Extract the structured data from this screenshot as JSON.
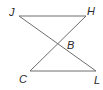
{
  "diagram": {
    "type": "geometry",
    "colors": {
      "line": "#6e6e6e",
      "label": "#2a2a2a",
      "background": "#ffffff"
    },
    "points": {
      "J": {
        "label": "J",
        "x": 19,
        "y": 16
      },
      "H": {
        "label": "H",
        "x": 86,
        "y": 16
      },
      "B": {
        "label": "B",
        "x": 58,
        "y": 44
      },
      "C": {
        "label": "C",
        "x": 30,
        "y": 71
      },
      "L": {
        "label": "L",
        "x": 96,
        "y": 71
      }
    },
    "segments": [
      {
        "name": "JH",
        "from": "J",
        "to": "H"
      },
      {
        "name": "CL",
        "from": "C",
        "to": "L"
      },
      {
        "name": "JL",
        "from": "J",
        "to": "L"
      },
      {
        "name": "HC",
        "from": "H",
        "to": "C"
      }
    ]
  }
}
